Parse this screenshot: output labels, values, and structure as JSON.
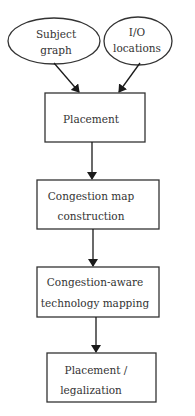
{
  "diagram": {
    "type": "flowchart",
    "inputs": [
      {
        "id": "subject-graph",
        "shape": "ellipse",
        "lines": [
          "Subject",
          "graph"
        ]
      },
      {
        "id": "io-locations",
        "shape": "ellipse",
        "lines": [
          "I/O",
          "locations"
        ]
      }
    ],
    "steps": [
      {
        "id": "placement",
        "shape": "rect",
        "lines": [
          "Placement"
        ]
      },
      {
        "id": "congestion-map",
        "shape": "rect",
        "lines": [
          "Congestion map",
          "construction"
        ]
      },
      {
        "id": "tech-mapping",
        "shape": "rect",
        "lines": [
          "Congestion-aware",
          "technology mapping"
        ]
      },
      {
        "id": "legalization",
        "shape": "rect",
        "lines": [
          "Placement /",
          "legalization"
        ]
      }
    ],
    "edges": [
      {
        "from": "subject-graph",
        "to": "placement"
      },
      {
        "from": "io-locations",
        "to": "placement"
      },
      {
        "from": "placement",
        "to": "congestion-map"
      },
      {
        "from": "congestion-map",
        "to": "tech-mapping"
      },
      {
        "from": "tech-mapping",
        "to": "legalization"
      }
    ],
    "colors": {
      "stroke": "#333333",
      "text": "#333333",
      "background": "#ffffff"
    }
  }
}
